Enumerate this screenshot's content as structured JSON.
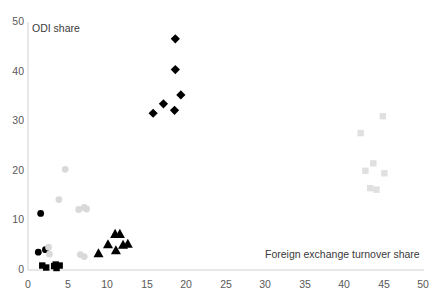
{
  "chart_data": {
    "type": "scatter",
    "title": "",
    "xlabel": "Foreign exchange turnover share",
    "ylabel": "ODI share",
    "xlim": [
      0,
      50
    ],
    "ylim": [
      0,
      50
    ],
    "xticks": [
      0,
      5,
      10,
      15,
      20,
      25,
      30,
      35,
      40,
      45,
      50
    ],
    "yticks": [
      0,
      10,
      20,
      30,
      40,
      50
    ],
    "grid": false,
    "legend": "none",
    "series": [
      {
        "name": "black-diamonds",
        "marker": "diamond",
        "color": "#000000",
        "points": [
          [
            18.6,
            46.6
          ],
          [
            18.6,
            40.4
          ],
          [
            19.3,
            35.3
          ],
          [
            17.1,
            33.5
          ],
          [
            18.5,
            32.2
          ],
          [
            15.8,
            31.6
          ]
        ]
      },
      {
        "name": "black-triangles",
        "marker": "triangle",
        "color": "#000000",
        "points": [
          [
            11.0,
            7.3
          ],
          [
            11.6,
            7.3
          ],
          [
            12.6,
            5.3
          ],
          [
            12.0,
            5.1
          ],
          [
            10.1,
            5.2
          ],
          [
            11.1,
            4.0
          ],
          [
            8.9,
            3.4
          ]
        ]
      },
      {
        "name": "black-circles",
        "marker": "circle",
        "color": "#000000",
        "points": [
          [
            1.6,
            11.4
          ],
          [
            1.3,
            3.6
          ],
          [
            2.2,
            4.1
          ]
        ]
      },
      {
        "name": "black-squares",
        "marker": "square",
        "color": "#000000",
        "points": [
          [
            1.8,
            0.9
          ],
          [
            2.3,
            0.5
          ],
          [
            3.3,
            0.8
          ],
          [
            3.6,
            0.4
          ],
          [
            4.0,
            0.9
          ],
          [
            3.5,
            1.1
          ]
        ]
      },
      {
        "name": "gray-circles",
        "marker": "circle",
        "color": "#d9d9d9",
        "points": [
          [
            4.7,
            20.3
          ],
          [
            3.9,
            14.2
          ],
          [
            6.4,
            12.2
          ],
          [
            7.1,
            12.6
          ],
          [
            7.4,
            12.3
          ],
          [
            6.6,
            3.1
          ],
          [
            7.1,
            2.7
          ],
          [
            2.6,
            4.6
          ],
          [
            2.7,
            3.2
          ]
        ]
      },
      {
        "name": "gray-squares",
        "marker": "square",
        "color": "#e0e0e0",
        "points": [
          [
            44.8,
            31.0
          ],
          [
            42.0,
            27.6
          ],
          [
            43.6,
            21.5
          ],
          [
            42.6,
            20.0
          ],
          [
            45.0,
            19.5
          ],
          [
            43.2,
            16.5
          ],
          [
            44.0,
            16.2
          ]
        ]
      }
    ]
  },
  "axes": {
    "y_title": "ODI share",
    "x_title": "Foreign exchange turnover share",
    "y_tick_labels": [
      "50",
      "40",
      "30",
      "20",
      "10",
      "0"
    ],
    "x_tick_labels": [
      "0",
      "5",
      "10",
      "15",
      "20",
      "25",
      "30",
      "35",
      "40",
      "45",
      "50"
    ]
  },
  "colors": {
    "axis_line": "#d0d0d0",
    "tick_text": "#595959",
    "title_text": "#3a3a3a",
    "black_marker": "#000000",
    "gray_circle_marker": "#d9d9d9",
    "gray_square_marker": "#e0e0e0",
    "background": "#ffffff"
  }
}
